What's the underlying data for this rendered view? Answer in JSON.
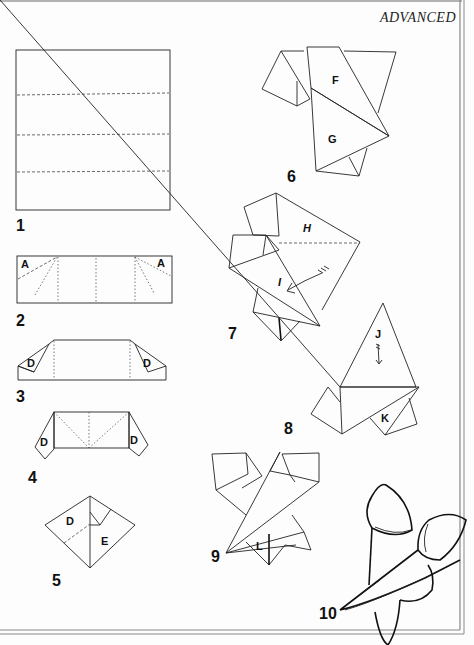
{
  "page": {
    "header_title": "ADVANCED",
    "border_color": "#888888",
    "ink_color": "#222222"
  },
  "steps": [
    {
      "number": "1",
      "labels": []
    },
    {
      "number": "2",
      "labels": [
        "A",
        "A"
      ]
    },
    {
      "number": "3",
      "labels": [
        "D",
        "D"
      ]
    },
    {
      "number": "4",
      "labels": [
        "D",
        "D"
      ]
    },
    {
      "number": "5",
      "labels": [
        "D",
        "E"
      ]
    },
    {
      "number": "6",
      "labels": [
        "F",
        "G"
      ]
    },
    {
      "number": "7",
      "labels": [
        "H",
        "I"
      ]
    },
    {
      "number": "8",
      "labels": [
        "J",
        "K"
      ]
    },
    {
      "number": "9",
      "labels": [
        "L"
      ]
    },
    {
      "number": "10",
      "labels": []
    }
  ]
}
